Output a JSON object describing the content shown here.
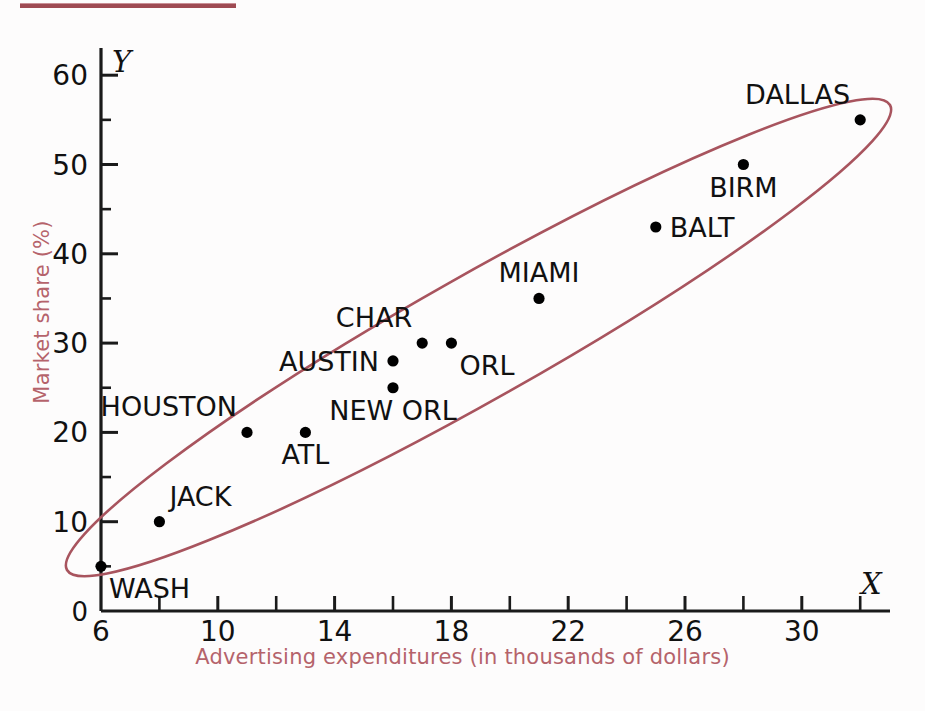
{
  "chart_data": {
    "type": "scatter",
    "title": "",
    "xlabel": "Advertising expenditures (in thousands of dollars)",
    "ylabel": "Market share (%)",
    "x_axis_symbol": "X",
    "y_axis_symbol": "Y",
    "xlim": [
      6,
      33
    ],
    "ylim": [
      0,
      63
    ],
    "x_ticks_major": [
      6,
      10,
      14,
      18,
      22,
      26,
      30
    ],
    "x_ticks_minor": [
      8,
      12,
      16,
      20,
      24,
      28,
      32
    ],
    "y_ticks_major": [
      0,
      10,
      20,
      30,
      40,
      50,
      60
    ],
    "y_ticks_minor": [
      5,
      15,
      25,
      35,
      45,
      55
    ],
    "grid": false,
    "legend": "none",
    "annotation_ellipse": {
      "present": true,
      "color": "#a8545e",
      "description": "hand-drawn rotated ellipse enclosing all points"
    },
    "points": [
      {
        "label": "WASH",
        "x": 6,
        "y": 5,
        "label_pos": "below-right"
      },
      {
        "label": "JACK",
        "x": 8,
        "y": 10,
        "label_pos": "above-right"
      },
      {
        "label": "HOUSTON",
        "x": 11,
        "y": 20,
        "label_pos": "above-left"
      },
      {
        "label": "ATL",
        "x": 13,
        "y": 20,
        "label_pos": "below"
      },
      {
        "label": "NEW ORL",
        "x": 16,
        "y": 25,
        "label_pos": "below"
      },
      {
        "label": "AUSTIN",
        "x": 16,
        "y": 28,
        "label_pos": "left"
      },
      {
        "label": "CHAR",
        "x": 17,
        "y": 30,
        "label_pos": "above-left"
      },
      {
        "label": "ORL",
        "x": 18,
        "y": 30,
        "label_pos": "below-right"
      },
      {
        "label": "MIAMI",
        "x": 21,
        "y": 35,
        "label_pos": "above"
      },
      {
        "label": "BALT",
        "x": 25,
        "y": 43,
        "label_pos": "right"
      },
      {
        "label": "BIRM",
        "x": 28,
        "y": 50,
        "label_pos": "below"
      },
      {
        "label": "DALLAS",
        "x": 32,
        "y": 55,
        "label_pos": "above-left"
      }
    ]
  },
  "colors": {
    "accent": "#b5636b",
    "ellipse": "#a8545e",
    "axis": "#1a1a1a",
    "point": "#000000",
    "rule": "#9e4a52",
    "background": "#fdfcfc"
  },
  "tick_labels": {
    "x": [
      "6",
      "10",
      "14",
      "18",
      "22",
      "26",
      "30"
    ],
    "y": [
      "0",
      "10",
      "20",
      "30",
      "40",
      "50",
      "60"
    ]
  }
}
